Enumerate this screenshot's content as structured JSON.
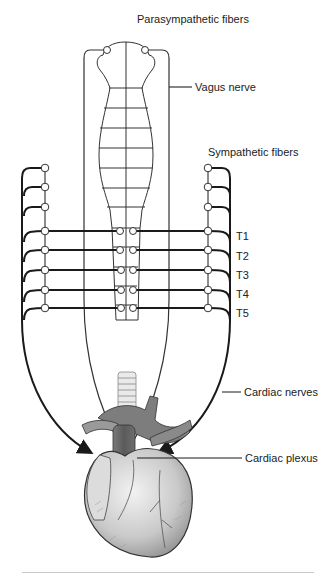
{
  "diagram": {
    "title_hidden": "",
    "labels": {
      "parasympathetic": "Parasympathetic fibers",
      "vagus": "Vagus nerve",
      "sympathetic": "Sympathetic fibers",
      "cardiac_nerves": "Cardiac nerves",
      "cardiac_plexus": "Cardiac plexus"
    },
    "segments": [
      "T1",
      "T2",
      "T3",
      "T4",
      "T5"
    ],
    "colors": {
      "line": "#1a1a1a",
      "thin_line": "#333333",
      "heart_light": "#e6e6e6",
      "heart_mid": "#a8a8a8",
      "heart_dark": "#5e5e5e",
      "rule": "#c8c8c8"
    }
  }
}
